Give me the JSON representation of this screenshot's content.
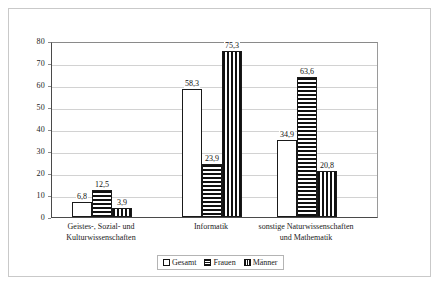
{
  "chart_data": {
    "type": "bar",
    "title": "",
    "subtitle": "",
    "xlabel": "",
    "ylabel": "",
    "ylim": [
      0,
      80
    ],
    "yticks": [
      "0",
      "10",
      "20",
      "30",
      "40",
      "50",
      "60",
      "70",
      "80"
    ],
    "grid": true,
    "legend_position": "bottom-center",
    "decimal_separator": ",",
    "categories": [
      "Geistes-, Sozial- und Kulturwissenschaften",
      "Informatik",
      "sonstige Naturwissenschaften und Mathematik"
    ],
    "category_lines": [
      [
        "Geistes-, Sozial- und",
        "Kulturwissenschaften"
      ],
      [
        "Informatik",
        ""
      ],
      [
        "sonstige Naturwissenschaften",
        "und Mathematik"
      ]
    ],
    "series": [
      {
        "name": "Gesamt",
        "pattern": "solid-white",
        "values": [
          6.8,
          58.3,
          34.9
        ],
        "labels": [
          "6,8",
          "58,3",
          "34,9"
        ]
      },
      {
        "name": "Frauen",
        "pattern": "horizontal-stripes",
        "values": [
          12.5,
          23.9,
          63.6
        ],
        "labels": [
          "12,5",
          "23,9",
          "63,6"
        ]
      },
      {
        "name": "Männer",
        "pattern": "vertical-stripes",
        "values": [
          3.9,
          75.3,
          20.8
        ],
        "labels": [
          "3,9",
          "75,3",
          "20,8"
        ]
      }
    ]
  },
  "legend": {
    "items": [
      {
        "label": "Gesamt"
      },
      {
        "label": "Frauen"
      },
      {
        "label": "Männer"
      }
    ]
  },
  "axis": {
    "y_tick_0": "0",
    "y_tick_10": "10",
    "y_tick_20": "20",
    "y_tick_30": "30",
    "y_tick_40": "40",
    "y_tick_50": "50",
    "y_tick_60": "60",
    "y_tick_70": "70",
    "y_tick_80": "80"
  },
  "colors": {
    "bar_outline": "#1a1a1a",
    "pattern_fill": "#111111",
    "gridline": "#d2d2d2",
    "axis": "#4a4a4a",
    "frame": "#c9c9c9",
    "text": "#1a1a1a",
    "background": "#ffffff"
  }
}
